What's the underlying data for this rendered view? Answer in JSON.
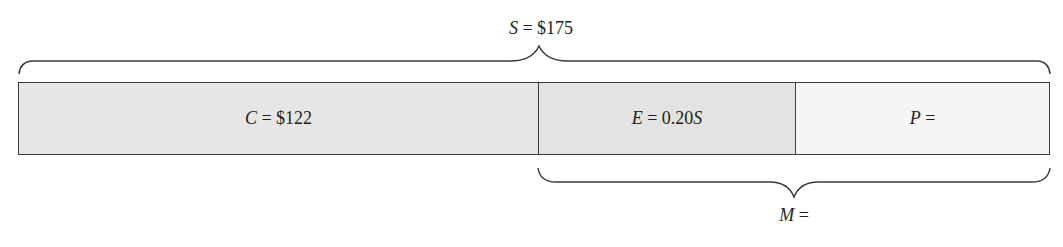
{
  "diagram": {
    "top_brace": {
      "var": "S",
      "rest": " = $175"
    },
    "bottom_brace": {
      "var": "M",
      "rest": " ="
    },
    "segments": [
      {
        "var": "C",
        "rest": " = $122",
        "fill": "#e6e6e6",
        "width": 519
      },
      {
        "var": "E",
        "rest": " = 0.20",
        "suffix_var": "S",
        "fill": "#e3e3e3",
        "width": 257
      },
      {
        "var": "P",
        "rest": " =",
        "fill": "#f5f5f5",
        "width": 254
      }
    ]
  }
}
